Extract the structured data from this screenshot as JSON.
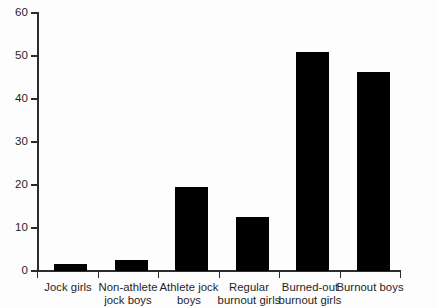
{
  "chart_data": {
    "type": "bar",
    "title": "",
    "xlabel": "",
    "ylabel": "",
    "ylim": [
      0,
      60
    ],
    "yticks": [
      0,
      10,
      20,
      30,
      40,
      50,
      60
    ],
    "grid": false,
    "legend": null,
    "bar_color": "#000000",
    "axis_color": "#2b2b2b",
    "background": "#fdfdfd",
    "categories": [
      "Jock girls",
      "Non-athlete jock boys",
      "Athlete jock boys",
      "Regular burnout girls",
      "Burned-out burnout girls",
      "Burnout boys"
    ],
    "category_lines": [
      [
        "Jock girls",
        ""
      ],
      [
        "Non-athlete",
        "jock boys"
      ],
      [
        "Athlete jock",
        "boys"
      ],
      [
        "Regular",
        "burnout girls"
      ],
      [
        "Burned-out",
        "burnout girls"
      ],
      [
        "Burnout boys",
        ""
      ]
    ],
    "values": [
      1.6,
      2.6,
      19.5,
      12.5,
      51.0,
      46.3
    ]
  }
}
